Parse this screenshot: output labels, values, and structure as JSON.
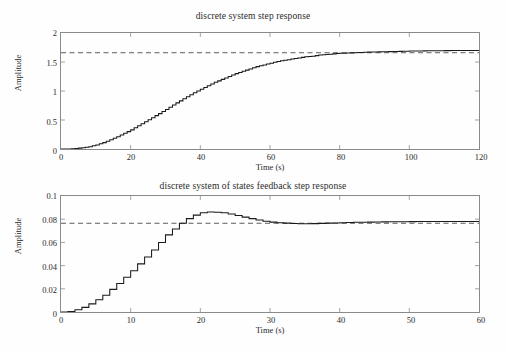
{
  "figure": {
    "background": "#fefefe",
    "axis_color": "#8a8a8a",
    "line_color": "#1a1a1a",
    "reference_color": "#4a4a4a"
  },
  "charts": [
    {
      "id": "discrete-system-step-response",
      "title": "discrete system step response",
      "xlabel": "Time (s)",
      "ylabel": "Amplitude"
    },
    {
      "id": "states-feedback-step-response",
      "title": "discrete system of states feedback step response",
      "xlabel": "Time (s)",
      "ylabel": "Amplitude"
    }
  ],
  "chart_data": [
    {
      "type": "line",
      "title": "discrete system step response",
      "xlabel": "Time (s)",
      "ylabel": "Amplitude",
      "xlim": [
        0,
        120
      ],
      "ylim": [
        0,
        2
      ],
      "xticks": [
        0,
        20,
        40,
        60,
        80,
        100,
        120
      ],
      "yticks": [
        0,
        0.5,
        1,
        1.5,
        2
      ],
      "xtick_labels": [
        "0",
        "20",
        "40",
        "60",
        "80",
        "100",
        "120"
      ],
      "ytick_labels": [
        "0",
        "0.5",
        "1",
        "1.5",
        "2"
      ],
      "grid": false,
      "legend": null,
      "reference_line": {
        "y": 1.66,
        "style": "dashed",
        "label": "steady-state reference"
      },
      "series": [
        {
          "name": "step response",
          "style": "staircase",
          "x": [
            0,
            2,
            4,
            6,
            8,
            10,
            12,
            14,
            16,
            18,
            20,
            22,
            24,
            26,
            28,
            30,
            32,
            34,
            36,
            38,
            40,
            42,
            44,
            46,
            48,
            50,
            52,
            54,
            56,
            58,
            60,
            62,
            64,
            66,
            68,
            70,
            72,
            74,
            76,
            78,
            80,
            82,
            84,
            86,
            88,
            90,
            92,
            94,
            96,
            98,
            100,
            102,
            104,
            106,
            108,
            110,
            112,
            114,
            116,
            118,
            120
          ],
          "y": [
            0.0,
            0.0,
            0.01,
            0.02,
            0.04,
            0.07,
            0.11,
            0.16,
            0.21,
            0.27,
            0.33,
            0.4,
            0.47,
            0.54,
            0.61,
            0.68,
            0.76,
            0.83,
            0.9,
            0.97,
            1.03,
            1.09,
            1.15,
            1.2,
            1.25,
            1.3,
            1.34,
            1.38,
            1.42,
            1.45,
            1.48,
            1.51,
            1.53,
            1.55,
            1.57,
            1.59,
            1.6,
            1.62,
            1.63,
            1.64,
            1.65,
            1.655,
            1.66,
            1.665,
            1.67,
            1.673,
            1.676,
            1.679,
            1.682,
            1.685,
            1.688,
            1.69,
            1.692,
            1.694,
            1.695,
            1.696,
            1.697,
            1.698,
            1.699,
            1.7,
            1.7
          ]
        }
      ]
    },
    {
      "type": "line",
      "title": "discrete system of states feedback step response",
      "xlabel": "Time (s)",
      "ylabel": "Amplitude",
      "xlim": [
        0,
        60
      ],
      "ylim": [
        0,
        0.1
      ],
      "xticks": [
        0,
        10,
        20,
        30,
        40,
        50,
        60
      ],
      "yticks": [
        0,
        0.02,
        0.04,
        0.06,
        0.08,
        0.1
      ],
      "xtick_labels": [
        "0",
        "10",
        "20",
        "30",
        "40",
        "50",
        "60"
      ],
      "ytick_labels": [
        "0",
        "0.02",
        "0.04",
        "0.06",
        "0.08",
        "0.1"
      ],
      "grid": false,
      "legend": null,
      "reference_line": {
        "y": 0.0765,
        "style": "dashed",
        "label": "steady-state reference"
      },
      "series": [
        {
          "name": "states feedback step response",
          "style": "staircase",
          "x": [
            0,
            1,
            2,
            3,
            4,
            5,
            6,
            7,
            8,
            9,
            10,
            11,
            12,
            13,
            14,
            15,
            16,
            17,
            18,
            19,
            20,
            21,
            22,
            23,
            24,
            25,
            26,
            27,
            28,
            29,
            30,
            31,
            32,
            33,
            34,
            35,
            36,
            37,
            38,
            39,
            40,
            42,
            44,
            46,
            48,
            50,
            52,
            54,
            56,
            58,
            60
          ],
          "y": [
            0.0,
            0.0005,
            0.002,
            0.004,
            0.007,
            0.0105,
            0.0145,
            0.0195,
            0.0245,
            0.03,
            0.0355,
            0.0415,
            0.0475,
            0.0535,
            0.06,
            0.0665,
            0.0715,
            0.0765,
            0.0805,
            0.0835,
            0.0855,
            0.0862,
            0.086,
            0.0855,
            0.0845,
            0.0832,
            0.0818,
            0.0805,
            0.0793,
            0.0783,
            0.0775,
            0.077,
            0.0766,
            0.0763,
            0.0761,
            0.076,
            0.0762,
            0.0764,
            0.0766,
            0.0768,
            0.077,
            0.0773,
            0.0775,
            0.0777,
            0.0778,
            0.0779,
            0.078,
            0.078,
            0.0781,
            0.0781,
            0.0781
          ]
        }
      ]
    }
  ]
}
